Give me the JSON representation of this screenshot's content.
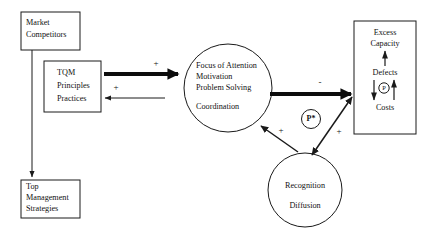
{
  "diagram": {
    "nodes": {
      "market": {
        "name": "market-competitors",
        "lines": [
          "Market",
          "Competitors"
        ]
      },
      "tqm": {
        "name": "tqm-principles-practices",
        "lines": [
          "TQM",
          "Principles",
          "Practices"
        ]
      },
      "top_mgmt": {
        "name": "top-management-strategies",
        "lines": [
          "Top",
          "Management",
          "Strategies"
        ]
      },
      "focus": {
        "name": "focus-of-attention",
        "lines": [
          "Focus of Attention",
          "Motivation",
          "Problem Solving",
          "Coordination"
        ]
      },
      "capacity": {
        "name": "excess-capacity-box",
        "lines": [
          "Excess",
          "Capacity",
          "Defects",
          "Costs"
        ]
      },
      "recognition": {
        "name": "recognition-diffusion",
        "lines": [
          "Recognition",
          "Diffusion"
        ]
      }
    },
    "markers": {
      "p_star": "P*",
      "p_inner": "P"
    },
    "signs": {
      "tqm_to_focus": "+",
      "focus_to_tqm": "+",
      "focus_to_capacity": "-",
      "recognition_to_focus": "+",
      "capacity_to_recognition": "+"
    },
    "colors": {
      "stroke": "#1a1a1a",
      "background": "#ffffff",
      "text": "#111111"
    }
  }
}
